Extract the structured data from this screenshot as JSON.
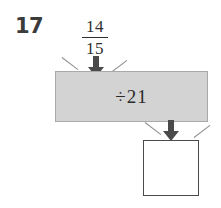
{
  "problem": {
    "number": "17",
    "input": {
      "label": "14/15",
      "numerator": "14",
      "denominator": "15"
    },
    "machine": {
      "operation": "÷21",
      "operator_symbol": "÷",
      "operand": "21",
      "fill_color": "#d3d3d3",
      "border_color": "#a9a9a9"
    },
    "output": {
      "value": "",
      "border_color": "#4a4a4a"
    },
    "arrows": {
      "into_machine": "down-arrow-icon",
      "out_of_machine": "down-arrow-icon",
      "color": "#4a4a4a"
    },
    "funnel": {
      "icon": "funnel-notch-icon",
      "color": "#8f8f8f"
    }
  }
}
